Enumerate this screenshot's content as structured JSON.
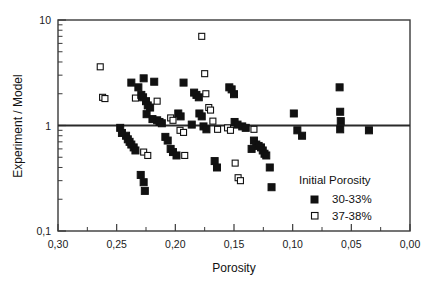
{
  "chart_data": {
    "type": "scatter",
    "title": "",
    "xlabel": "Porosity",
    "ylabel": "Experiment / Model",
    "xlim": [
      0.3,
      0.0
    ],
    "ylim": [
      0.1,
      10
    ],
    "yscale": "log",
    "xscale": "linear",
    "x_reversed": true,
    "grid": false,
    "reference_line_y": 1,
    "legend_title": "Initial Porosity",
    "legend_position": "bottom-right-inside",
    "xticks": [
      0.3,
      0.25,
      0.2,
      0.15,
      0.1,
      0.05,
      0.0
    ],
    "xticklabels": [
      "0,30",
      "0,25",
      "0,20",
      "0,15",
      "0,10",
      "0,05",
      "0,00"
    ],
    "yticks": [
      0.1,
      1,
      10
    ],
    "yticklabels": [
      "0,1",
      "1",
      "10"
    ],
    "series": [
      {
        "name": "30-33%",
        "marker": "filled-square",
        "color": "#111111",
        "points": [
          [
            0.2375,
            2.55
          ],
          [
            0.2315,
            2.3
          ],
          [
            0.227,
            2.8
          ],
          [
            0.229,
            1.95
          ],
          [
            0.2275,
            1.85
          ],
          [
            0.225,
            1.7
          ],
          [
            0.2235,
            1.55
          ],
          [
            0.2215,
            1.48
          ],
          [
            0.218,
            2.6
          ],
          [
            0.2245,
            1.28
          ],
          [
            0.2195,
            1.15
          ],
          [
            0.2155,
            1.12
          ],
          [
            0.2135,
            1.08
          ],
          [
            0.2115,
            1.05
          ],
          [
            0.247,
            0.95
          ],
          [
            0.242,
            0.8
          ],
          [
            0.2405,
            0.74
          ],
          [
            0.239,
            0.7
          ],
          [
            0.2375,
            0.66
          ],
          [
            0.2355,
            0.62
          ],
          [
            0.234,
            0.58
          ],
          [
            0.2455,
            0.85
          ],
          [
            0.2295,
            0.34
          ],
          [
            0.227,
            0.29
          ],
          [
            0.226,
            0.24
          ],
          [
            0.2085,
            0.78
          ],
          [
            0.2065,
            0.72
          ],
          [
            0.204,
            0.6
          ],
          [
            0.202,
            0.56
          ],
          [
            0.199,
            0.52
          ],
          [
            0.1975,
            1.3
          ],
          [
            0.1955,
            1.22
          ],
          [
            0.193,
            2.55
          ],
          [
            0.184,
            2.05
          ],
          [
            0.182,
            1.95
          ],
          [
            0.18,
            1.85
          ],
          [
            0.1795,
            1.3
          ],
          [
            0.1775,
            1.22
          ],
          [
            0.186,
            1.02
          ],
          [
            0.176,
            0.98
          ],
          [
            0.1735,
            0.92
          ],
          [
            0.1665,
            0.46
          ],
          [
            0.1645,
            0.4
          ],
          [
            0.154,
            2.3
          ],
          [
            0.152,
            2.2
          ],
          [
            0.15,
            1.98
          ],
          [
            0.1495,
            1.08
          ],
          [
            0.147,
            1.02
          ],
          [
            0.143,
            0.98
          ],
          [
            0.14,
            0.95
          ],
          [
            0.133,
            0.72
          ],
          [
            0.131,
            0.66
          ],
          [
            0.129,
            0.64
          ],
          [
            0.127,
            0.62
          ],
          [
            0.1255,
            0.58
          ],
          [
            0.124,
            0.54
          ],
          [
            0.1225,
            0.52
          ],
          [
            0.135,
            0.6
          ],
          [
            0.1195,
            0.4
          ],
          [
            0.118,
            0.26
          ],
          [
            0.099,
            1.3
          ],
          [
            0.096,
            0.9
          ],
          [
            0.092,
            0.8
          ],
          [
            0.06,
            2.3
          ],
          [
            0.0595,
            1.35
          ],
          [
            0.059,
            1.1
          ],
          [
            0.0595,
            0.92
          ],
          [
            0.035,
            0.9
          ]
        ]
      },
      {
        "name": "37-38%",
        "marker": "open-square",
        "color": "#ffffff",
        "points": [
          [
            0.264,
            3.6
          ],
          [
            0.262,
            1.85
          ],
          [
            0.26,
            1.8
          ],
          [
            0.234,
            1.82
          ],
          [
            0.227,
            0.56
          ],
          [
            0.2235,
            0.52
          ],
          [
            0.2155,
            1.7
          ],
          [
            0.204,
            1.18
          ],
          [
            0.202,
            1.12
          ],
          [
            0.196,
            0.9
          ],
          [
            0.193,
            0.86
          ],
          [
            0.192,
            0.52
          ],
          [
            0.1775,
            7.0
          ],
          [
            0.175,
            3.1
          ],
          [
            0.174,
            2.0
          ],
          [
            0.1715,
            1.48
          ],
          [
            0.17,
            1.4
          ],
          [
            0.168,
            1.1
          ],
          [
            0.164,
            0.92
          ],
          [
            0.1555,
            0.95
          ],
          [
            0.153,
            0.9
          ],
          [
            0.149,
            0.44
          ],
          [
            0.1465,
            0.32
          ],
          [
            0.1445,
            0.3
          ],
          [
            0.133,
            0.92
          ]
        ]
      }
    ]
  },
  "axes": {
    "ylabel": "Experiment / Model",
    "xlabel": "Porosity"
  },
  "legend": {
    "title": "Initial Porosity",
    "entries": [
      {
        "label": "30-33%",
        "marker": "filled-square"
      },
      {
        "label": "37-38%",
        "marker": "open-square"
      }
    ]
  }
}
